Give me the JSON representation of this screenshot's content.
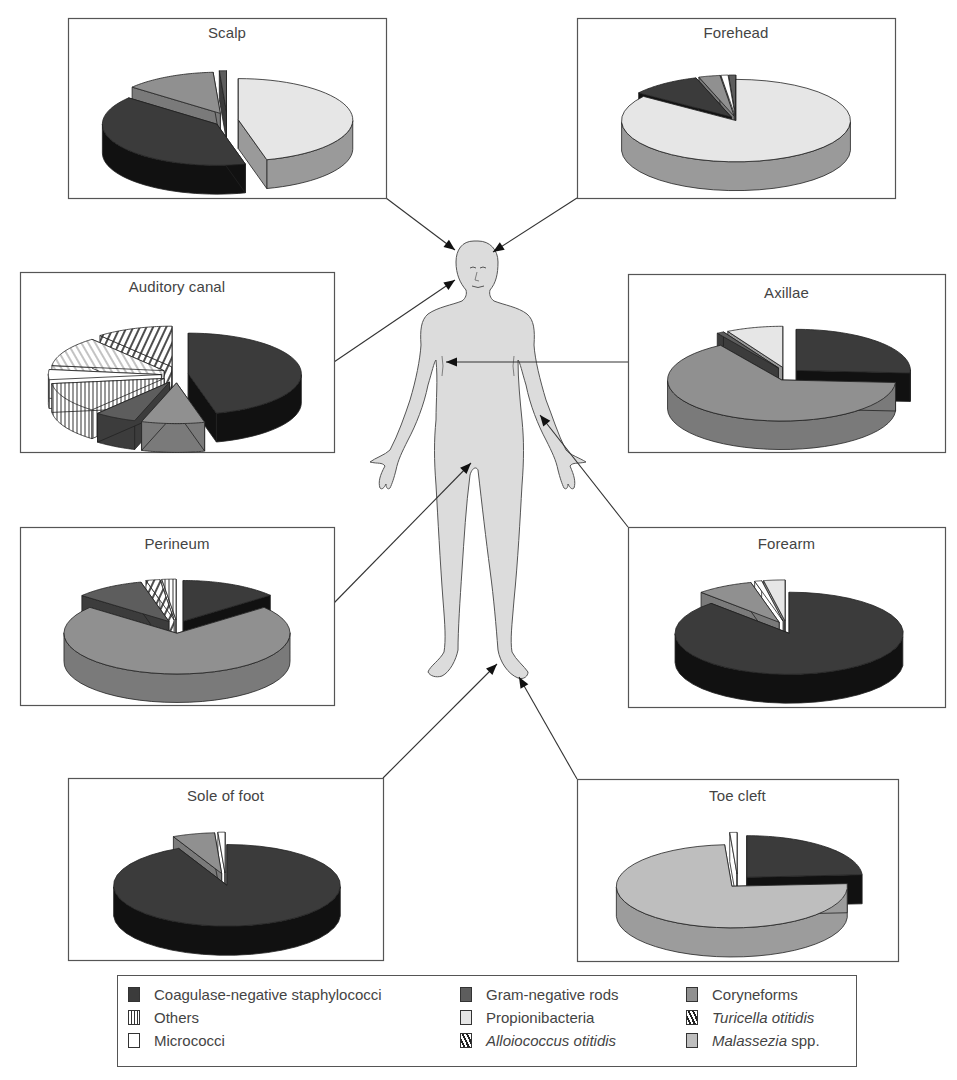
{
  "figure": {
    "center_image": "human-body-figure",
    "legend_position": "bottom"
  },
  "categories": {
    "cons": {
      "label": "Coagulase-negative staphylococci",
      "italic": "",
      "suffix": "",
      "color": "#3b3b3b",
      "side": "#111111",
      "pattern": "solid"
    },
    "gnr": {
      "label": "Gram-negative rods",
      "italic": "",
      "suffix": "",
      "color": "#5d5d5d",
      "side": "#3c3c3c",
      "pattern": "solid"
    },
    "cory": {
      "label": "Coryneforms",
      "italic": "",
      "suffix": "",
      "color": "#909090",
      "side": "#7a7a7a",
      "pattern": "solid"
    },
    "others": {
      "label": "Others",
      "italic": "",
      "suffix": "",
      "color": "#ffffff",
      "side": "#ffffff",
      "pattern": "vertical"
    },
    "prop": {
      "label": "Propionibacteria",
      "italic": "",
      "suffix": "",
      "color": "#e6e6e6",
      "side": "#9a9a9a",
      "pattern": "solid"
    },
    "turi": {
      "label": "",
      "italic": "Turicella otitidis",
      "suffix": "",
      "color": "#ffffff",
      "side": "#ffffff",
      "pattern": "diag-light"
    },
    "micro": {
      "label": "Micrococci",
      "italic": "",
      "suffix": "",
      "color": "#ffffff",
      "side": "#ffffff",
      "pattern": "solid"
    },
    "allo": {
      "label": "",
      "italic": "Alloiococcus otitidis",
      "suffix": "",
      "color": "#ffffff",
      "side": "#ffffff",
      "pattern": "diag"
    },
    "mala": {
      "label": "",
      "italic": "Malassezia",
      "suffix": " spp.",
      "color": "#bebebe",
      "side": "#9c9c9c",
      "pattern": "solid"
    }
  },
  "legend": {
    "items": [
      {
        "key": "cons",
        "col": 0,
        "row": 0
      },
      {
        "key": "others",
        "col": 0,
        "row": 1
      },
      {
        "key": "micro",
        "col": 0,
        "row": 2
      },
      {
        "key": "gnr",
        "col": 1,
        "row": 0
      },
      {
        "key": "prop",
        "col": 1,
        "row": 1
      },
      {
        "key": "allo",
        "col": 1,
        "row": 2
      },
      {
        "key": "cory",
        "col": 2,
        "row": 0
      },
      {
        "key": "turi",
        "col": 2,
        "row": 1
      },
      {
        "key": "mala",
        "col": 2,
        "row": 2
      }
    ]
  },
  "chart_data": [
    {
      "type": "pie",
      "title": "Scalp",
      "box": [
        68,
        18,
        318,
        180
      ],
      "target": [
        455,
        250
      ],
      "anchor": [
        386,
        198
      ],
      "start": 90,
      "slices": [
        {
          "key": "prop",
          "value": 46
        },
        {
          "key": "cons",
          "value": 40
        },
        {
          "key": "cory",
          "value": 13
        },
        {
          "key": "gnr",
          "value": 1
        }
      ],
      "explode": true
    },
    {
      "type": "pie",
      "title": "Forehead",
      "box": [
        577,
        18,
        318,
        180
      ],
      "target": [
        493,
        252
      ],
      "anchor": [
        577,
        198
      ],
      "start": 90,
      "slices": [
        {
          "key": "prop",
          "value": 85
        },
        {
          "key": "cons",
          "value": 10
        },
        {
          "key": "cory",
          "value": 3
        },
        {
          "key": "micro",
          "value": 1
        },
        {
          "key": "gnr",
          "value": 1
        }
      ],
      "explode": false
    },
    {
      "type": "pie",
      "title": "Auditory canal",
      "box": [
        20,
        272,
        314,
        180
      ],
      "target": [
        455,
        280
      ],
      "anchor": [
        334,
        362
      ],
      "start": 90,
      "slices": [
        {
          "key": "cons",
          "value": 46
        },
        {
          "key": "cory",
          "value": 9
        },
        {
          "key": "gnr",
          "value": 6
        },
        {
          "key": "others",
          "value": 12
        },
        {
          "key": "micro",
          "value": 4
        },
        {
          "key": "turi",
          "value": 12
        },
        {
          "key": "allo",
          "value": 11
        }
      ],
      "explode": true
    },
    {
      "type": "pie",
      "title": "Axillae",
      "box": [
        628,
        274,
        317,
        178
      ],
      "target": [
        446,
        362
      ],
      "anchor": [
        628,
        362
      ],
      "start": 90,
      "slices": [
        {
          "key": "cons",
          "value": 26
        },
        {
          "key": "cory",
          "value": 65
        },
        {
          "key": "gnr",
          "value": 1
        },
        {
          "key": "prop",
          "value": 8
        }
      ],
      "explode": true,
      "order": "custom"
    },
    {
      "type": "pie",
      "title": "Perineum",
      "box": [
        20,
        527,
        314,
        178
      ],
      "target": [
        471,
        463
      ],
      "anchor": [
        334,
        603
      ],
      "start": 90,
      "slices": [
        {
          "key": "cons",
          "value": 14
        },
        {
          "key": "cory",
          "value": 72
        },
        {
          "key": "gnr",
          "value": 10
        },
        {
          "key": "allo",
          "value": 2
        },
        {
          "key": "others",
          "value": 2
        }
      ],
      "explode": true
    },
    {
      "type": "pie",
      "title": "Forearm",
      "box": [
        628,
        527,
        317,
        180
      ],
      "target": [
        540,
        415
      ],
      "anchor": [
        628,
        527
      ],
      "start": 90,
      "slices": [
        {
          "key": "cons",
          "value": 88
        },
        {
          "key": "cory",
          "value": 8
        },
        {
          "key": "micro",
          "value": 1
        },
        {
          "key": "prop",
          "value": 3
        }
      ],
      "explode": true
    },
    {
      "type": "pie",
      "title": "Sole of foot",
      "box": [
        68,
        778,
        315,
        182
      ],
      "target": [
        497,
        664
      ],
      "anchor": [
        383,
        778
      ],
      "start": 90,
      "slices": [
        {
          "key": "cons",
          "value": 93
        },
        {
          "key": "cory",
          "value": 6
        },
        {
          "key": "micro",
          "value": 1
        }
      ],
      "explode": true
    },
    {
      "type": "pie",
      "title": "Toe cleft",
      "box": [
        577,
        779,
        321,
        182
      ],
      "target": [
        519,
        677
      ],
      "anchor": [
        577,
        779
      ],
      "start": 90,
      "slices": [
        {
          "key": "cons",
          "value": 24
        },
        {
          "key": "mala",
          "value": 75
        },
        {
          "key": "micro",
          "value": 1
        }
      ],
      "explode": true
    }
  ]
}
